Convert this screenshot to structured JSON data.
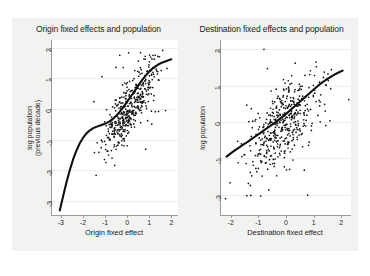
{
  "figure": {
    "background_color": "#f2f2f0",
    "panel_background": "#ffffff",
    "point_color": "#141414",
    "line_color": "#101010"
  },
  "chart_data": [
    {
      "type": "scatter",
      "panel": "origin",
      "title": "Origin fixed effects and population",
      "xlabel": "Origin fixed effect",
      "ylabel": "log population\n(previous decade)",
      "ylabel_line1": "log population",
      "ylabel_line2": "(previous decade)",
      "xlim": [
        -3.4,
        2.3
      ],
      "ylim": [
        -3.45,
        2.25
      ],
      "xticks": [
        -3,
        -2,
        -1,
        0,
        1,
        2
      ],
      "yticks": [
        2,
        1,
        0,
        -1,
        -2,
        -3
      ],
      "grid": "horizontal-faint",
      "legend": "none",
      "n_points": 430,
      "seed": 20240711,
      "cluster": {
        "x_mean": 0.15,
        "x_sd": 0.62,
        "slope": 1.02,
        "intercept": -0.12,
        "resid_sd": 0.42
      },
      "fit_line": {
        "name": "lowess",
        "points": [
          [
            -3.05,
            -3.3
          ],
          [
            -2.9,
            -2.85
          ],
          [
            -2.75,
            -2.4
          ],
          [
            -2.6,
            -2.0
          ],
          [
            -2.45,
            -1.65
          ],
          [
            -2.3,
            -1.36
          ],
          [
            -2.15,
            -1.12
          ],
          [
            -2.0,
            -0.94
          ],
          [
            -1.85,
            -0.8
          ],
          [
            -1.7,
            -0.7
          ],
          [
            -1.55,
            -0.63
          ],
          [
            -1.4,
            -0.58
          ],
          [
            -1.25,
            -0.54
          ],
          [
            -1.1,
            -0.5
          ],
          [
            -0.95,
            -0.46
          ],
          [
            -0.8,
            -0.4
          ],
          [
            -0.65,
            -0.32
          ],
          [
            -0.5,
            -0.22
          ],
          [
            -0.35,
            -0.1
          ],
          [
            -0.2,
            0.04
          ],
          [
            -0.05,
            0.19
          ],
          [
            0.1,
            0.34
          ],
          [
            0.25,
            0.5
          ],
          [
            0.4,
            0.66
          ],
          [
            0.55,
            0.82
          ],
          [
            0.7,
            0.97
          ],
          [
            0.85,
            1.1
          ],
          [
            1.0,
            1.22
          ],
          [
            1.15,
            1.32
          ],
          [
            1.3,
            1.4
          ],
          [
            1.45,
            1.47
          ],
          [
            1.6,
            1.52
          ],
          [
            1.75,
            1.56
          ],
          [
            1.9,
            1.6
          ],
          [
            2.0,
            1.62
          ]
        ]
      }
    },
    {
      "type": "scatter",
      "panel": "destination",
      "title": "Destination fixed effects and population",
      "xlabel": "Destination fixed effect",
      "ylabel": "log population",
      "xlim": [
        -2.35,
        2.35
      ],
      "ylim": [
        -2.55,
        2.25
      ],
      "xticks": [
        -2,
        -1,
        0,
        1,
        2
      ],
      "yticks": [
        2,
        1,
        0,
        -1,
        -2
      ],
      "grid": "horizontal-faint",
      "legend": "none",
      "n_points": 430,
      "seed": 987431,
      "cluster": {
        "x_mean": -0.1,
        "x_sd": 0.66,
        "slope": 0.72,
        "intercept": 0.02,
        "resid_sd": 0.52
      },
      "fit_line": {
        "name": "lowess",
        "points": [
          [
            -2.15,
            -0.95
          ],
          [
            -2.0,
            -0.86
          ],
          [
            -1.85,
            -0.78
          ],
          [
            -1.7,
            -0.7
          ],
          [
            -1.55,
            -0.62
          ],
          [
            -1.4,
            -0.55
          ],
          [
            -1.25,
            -0.47
          ],
          [
            -1.1,
            -0.39
          ],
          [
            -0.95,
            -0.31
          ],
          [
            -0.8,
            -0.23
          ],
          [
            -0.65,
            -0.15
          ],
          [
            -0.5,
            -0.07
          ],
          [
            -0.35,
            0.01
          ],
          [
            -0.2,
            0.1
          ],
          [
            -0.05,
            0.19
          ],
          [
            0.1,
            0.29
          ],
          [
            0.25,
            0.39
          ],
          [
            0.4,
            0.49
          ],
          [
            0.55,
            0.59
          ],
          [
            0.7,
            0.69
          ],
          [
            0.85,
            0.79
          ],
          [
            1.0,
            0.89
          ],
          [
            1.15,
            0.99
          ],
          [
            1.3,
            1.08
          ],
          [
            1.45,
            1.16
          ],
          [
            1.6,
            1.23
          ],
          [
            1.75,
            1.3
          ],
          [
            1.9,
            1.36
          ],
          [
            2.05,
            1.41
          ]
        ]
      }
    }
  ]
}
